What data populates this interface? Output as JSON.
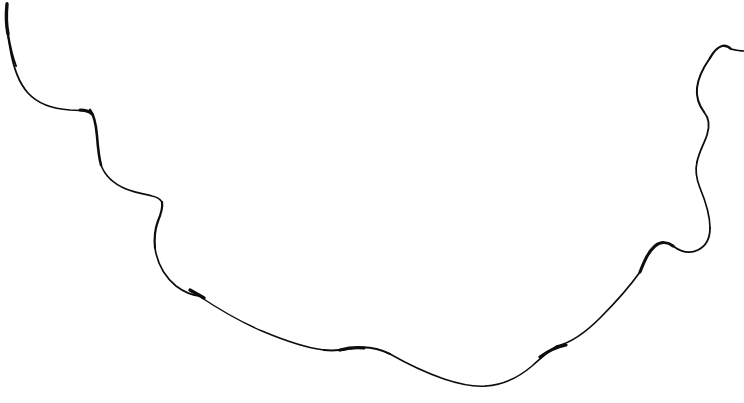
{
  "canvas": {
    "width": 744,
    "height": 403,
    "background_color": "#ffffff",
    "title": "hand-drawn-curve"
  },
  "drawing": {
    "kind": "freehand-line-drawing",
    "description": "A single continuous hand-drawn wavy line sweeping from the upper-left corner down across the lower middle of the frame and back up to the upper-right corner, resembling a scalloped horizon or cloud outline.",
    "stroke_color": "#0d0d0d",
    "stroke_count": 1,
    "base_stroke_width": 1.6,
    "paths": [
      {
        "name": "main-curve",
        "color": "#0d0d0d",
        "width": 1.7,
        "d": "M 7 3 C 6 18 7 34 10 48 C 13 66 18 82 28 93 C 38 104 54 109 70 110 C 78 110 85 111 90 112"
      },
      {
        "name": "cusp-descent",
        "color": "#0d0d0d",
        "width": 2.6,
        "d": "M 90 110 C 94 115 96 124 97 136 C 98 149 99 158 101 165"
      },
      {
        "name": "first-scallop",
        "color": "#0d0d0d",
        "width": 1.6,
        "d": "M 101 165 C 105 176 114 184 126 189 C 136 193 145 194 152 196 C 157 197 160 199 162 202"
      },
      {
        "name": "s-wiggle-left",
        "color": "#0d0d0d",
        "width": 2.2,
        "d": "M 162 202 C 163 208 161 214 158 221 C 155 229 154 238 155 248"
      },
      {
        "name": "second-scallop",
        "color": "#0d0d0d",
        "width": 1.7,
        "d": "M 155 248 C 157 262 164 276 176 286 C 184 292 192 295 199 296"
      },
      {
        "name": "thick-blob-left",
        "color": "#0d0d0d",
        "width": 3.4,
        "d": "M 190 290 C 195 293 199 295 204 298"
      },
      {
        "name": "long-descent",
        "color": "#0d0d0d",
        "width": 1.5,
        "d": "M 199 296 C 214 306 236 320 262 331 C 288 342 308 348 324 350"
      },
      {
        "name": "center-hump",
        "color": "#0d0d0d",
        "width": 2.0,
        "d": "M 324 350 C 334 351 344 350 354 348 C 366 346 378 348 390 354"
      },
      {
        "name": "hump-crest-thick",
        "color": "#0d0d0d",
        "width": 3.2,
        "d": "M 340 350 C 348 348 356 347 364 348"
      },
      {
        "name": "bottom-valley",
        "color": "#0d0d0d",
        "width": 1.5,
        "d": "M 390 354 C 404 362 424 372 444 379 C 462 385 474 387 486 386"
      },
      {
        "name": "valley-rise",
        "color": "#0d0d0d",
        "width": 1.6,
        "d": "M 486 386 C 502 385 518 378 532 366 C 542 357 550 350 557 346"
      },
      {
        "name": "thick-step-right",
        "color": "#0d0d0d",
        "width": 3.2,
        "d": "M 540 357 C 548 351 556 347 566 345"
      },
      {
        "name": "right-ascent",
        "color": "#0d0d0d",
        "width": 1.7,
        "d": "M 557 346 C 570 343 584 334 600 318 C 616 302 630 286 640 272"
      },
      {
        "name": "s-wiggle-right",
        "color": "#0d0d0d",
        "width": 3.0,
        "d": "M 640 272 C 644 262 648 252 655 246 C 661 241 668 242 673 246"
      },
      {
        "name": "right-bulge-upper",
        "color": "#0d0d0d",
        "width": 1.8,
        "d": "M 673 246 C 681 252 690 254 698 250 C 706 246 710 238 710 228"
      },
      {
        "name": "right-bulge-outer",
        "color": "#0d0d0d",
        "width": 1.7,
        "d": "M 710 228 C 710 214 705 200 700 188 C 696 178 695 170 697 162"
      },
      {
        "name": "right-wiggle-mid",
        "color": "#0d0d0d",
        "width": 1.8,
        "d": "M 697 162 C 699 152 704 144 707 135 C 710 126 709 118 704 112"
      },
      {
        "name": "right-wiggle-upper",
        "color": "#0d0d0d",
        "width": 2.0,
        "d": "M 704 112 C 699 105 696 97 697 88 C 698 78 703 68 710 58"
      },
      {
        "name": "right-peak",
        "color": "#0d0d0d",
        "width": 2.3,
        "d": "M 710 58 C 714 51 718 47 722 46 C 726 45 729 47 731 49"
      },
      {
        "name": "right-tail",
        "color": "#0d0d0d",
        "width": 1.4,
        "d": "M 731 49 C 735 50 739 51 744 51"
      },
      {
        "name": "left-start-thick",
        "color": "#0d0d0d",
        "width": 3.4,
        "d": "M 7 4 C 6 14 6 24 8 34"
      },
      {
        "name": "left-upper-taper",
        "color": "#0d0d0d",
        "width": 2.0,
        "d": "M 8 34 C 10 46 12 56 16 66"
      },
      {
        "name": "cusp-corner-thick",
        "color": "#0d0d0d",
        "width": 3.0,
        "d": "M 80 110 C 85 110 89 111 92 114"
      }
    ]
  },
  "annotations": {
    "text_present": "none",
    "labels": [],
    "axis_ticks": [],
    "legend_entries": []
  }
}
